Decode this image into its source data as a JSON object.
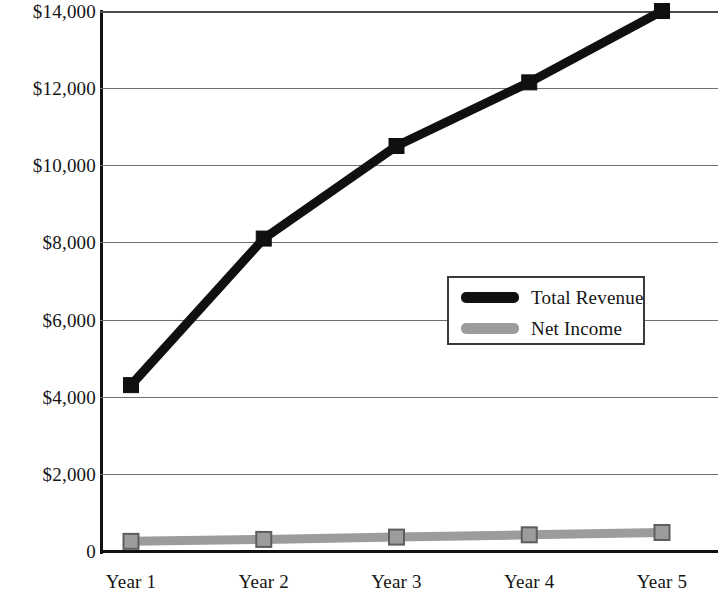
{
  "chart_data": {
    "type": "line",
    "title": "",
    "subtitle": "",
    "xlabel": "",
    "ylabel": "",
    "categories": [
      "Year 1",
      "Year 2",
      "Year 3",
      "Year 4",
      "Year 5"
    ],
    "series": [
      {
        "name": "Total Revenue",
        "color": "#101010",
        "values": [
          4300,
          8100,
          10500,
          12150,
          14000
        ]
      },
      {
        "name": "Net Income",
        "color": "#9c9c9c",
        "values": [
          250,
          300,
          360,
          420,
          480
        ]
      }
    ],
    "ylim": [
      0,
      14000
    ],
    "y_ticks": [
      0,
      2000,
      4000,
      6000,
      8000,
      10000,
      12000,
      14000
    ],
    "y_tick_labels": [
      "0",
      "$2,000",
      "$4,000",
      "$6,000",
      "$8,000",
      "$10,000",
      "$12,000",
      "$14,000"
    ],
    "grid": true,
    "grid_axis": "y",
    "legend_position": "center-right",
    "legend_entries": [
      "Total Revenue",
      "Net Income"
    ],
    "marker": "square",
    "annotations": []
  },
  "axes": {
    "y_labels": [
      "$14,000",
      "$12,000",
      "$10,000",
      "$8,000",
      "$6,000",
      "$4,000",
      "$2,000",
      "0"
    ],
    "x_labels": [
      "Year 1",
      "Year 2",
      "Year 3",
      "Year 4",
      "Year 5"
    ]
  },
  "legend": {
    "items": [
      {
        "label": "Total Revenue",
        "color": "#101010"
      },
      {
        "label": "Net Income",
        "color": "#9c9c9c"
      }
    ]
  },
  "colors": {
    "total_revenue": "#101010",
    "net_income": "#9c9c9c",
    "gridline": "#6f6f6f",
    "axis": "#111111",
    "background": "#ffffff"
  }
}
